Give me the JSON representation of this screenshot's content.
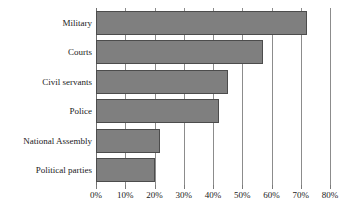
{
  "chart": {
    "title": "",
    "subtitle": "",
    "background_color": "#ffffff",
    "bar_fill_color": "#7f7f7f",
    "bar_border_color": "#4c4c4c",
    "gridline_color": "#8c8c8c",
    "text_color": "#1a1a1a"
  },
  "chart_data": {
    "type": "bar",
    "orientation": "horizontal",
    "title": "",
    "xlabel": "",
    "ylabel": "",
    "categories": [
      "Military",
      "Courts",
      "Civil servants",
      "Police",
      "National Assembly",
      "Political parties"
    ],
    "values": [
      72,
      57,
      45,
      42,
      22,
      20
    ],
    "value_unit": "%",
    "xlim": [
      0,
      80
    ],
    "xticks": [
      0,
      10,
      20,
      30,
      40,
      50,
      60,
      70,
      80
    ],
    "xtick_labels": [
      "0%",
      "10%",
      "20%",
      "30%",
      "40%",
      "50%",
      "60%",
      "70%",
      "80%"
    ],
    "grid": "vertical",
    "legend": "none",
    "data_labels": false,
    "series": [
      {
        "name": "",
        "values": [
          72,
          57,
          45,
          42,
          22,
          20
        ]
      }
    ]
  }
}
